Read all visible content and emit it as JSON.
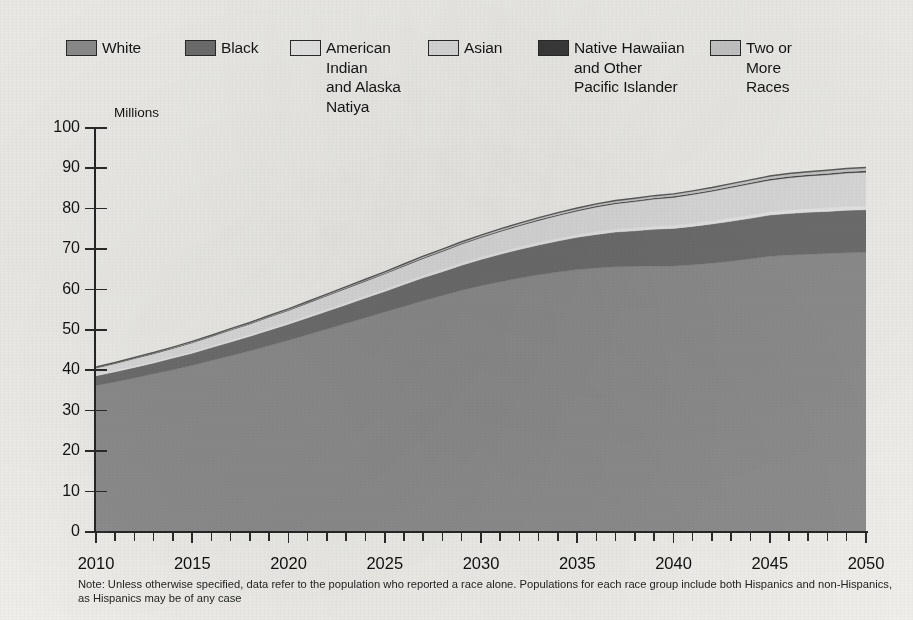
{
  "legend": {
    "items": [
      {
        "label": "White",
        "color": "#8e8e8e",
        "swatch_name": "legend-swatch-white"
      },
      {
        "label": "Black",
        "color": "#6f6f6f",
        "swatch_name": "legend-swatch-black"
      },
      {
        "label": "American Indian\nand Alaska\nNatiya",
        "color": "#e9e9e9",
        "swatch_name": "legend-swatch-american-indian"
      },
      {
        "label": "Asian",
        "color": "#dddddd",
        "swatch_name": "legend-swatch-asian"
      },
      {
        "label": "Native Hawaiian\nand Other\nPacific Islander",
        "color": "#3a3a3a",
        "swatch_name": "legend-swatch-native-hawaiian"
      },
      {
        "label": "Two or\nMore\nRaces",
        "color": "#c9c9c9",
        "swatch_name": "legend-swatch-two-or-more"
      }
    ]
  },
  "axes": {
    "y_axis_title": "Millions",
    "y_ticks": [
      "100",
      "90",
      "80",
      "70",
      "60",
      "50",
      "40",
      "30",
      "20",
      "10",
      "0"
    ],
    "x_ticks": [
      "2010",
      "2015",
      "2020",
      "2025",
      "2030",
      "2035",
      "2040",
      "2045",
      "2050"
    ]
  },
  "footnote": {
    "text": "Note: Unless otherwise specified, data refer to the population who reported a race alone. Populations for each race group include both Hispanics and non-Hispanics, as Hispanics may be of any case"
  },
  "chart_data": {
    "type": "area",
    "stacked": true,
    "title": "",
    "subtitle": "",
    "xlabel": "",
    "ylabel": "Millions",
    "xlim": [
      2010,
      2050
    ],
    "ylim": [
      0,
      100
    ],
    "y_tick_step": 10,
    "x_tick_step_minor": 1,
    "x_tick_step_major": 5,
    "grid": false,
    "legend_position": "top",
    "x": [
      2010,
      2011,
      2012,
      2013,
      2014,
      2015,
      2016,
      2017,
      2018,
      2019,
      2020,
      2021,
      2022,
      2023,
      2024,
      2025,
      2026,
      2027,
      2028,
      2029,
      2030,
      2031,
      2032,
      2033,
      2034,
      2035,
      2036,
      2037,
      2038,
      2039,
      2040,
      2041,
      2042,
      2043,
      2044,
      2045,
      2046,
      2047,
      2048,
      2049,
      2050
    ],
    "series": [
      {
        "name": "White",
        "color": "#8e8e8e",
        "values": [
          36.0,
          36.9,
          37.9,
          38.9,
          39.9,
          41.0,
          42.2,
          43.4,
          44.6,
          45.9,
          47.2,
          48.6,
          50.0,
          51.4,
          52.8,
          54.2,
          55.6,
          57.0,
          58.3,
          59.6,
          60.7,
          61.7,
          62.6,
          63.4,
          64.1,
          64.7,
          65.1,
          65.4,
          65.5,
          65.6,
          65.6,
          65.9,
          66.3,
          66.8,
          67.4,
          68.0,
          68.3,
          68.5,
          68.7,
          68.9,
          69.0
        ]
      },
      {
        "name": "Black",
        "color": "#6f6f6f",
        "values": [
          2.4,
          2.5,
          2.6,
          2.7,
          2.9,
          3.0,
          3.2,
          3.4,
          3.6,
          3.8,
          4.0,
          4.2,
          4.4,
          4.6,
          4.9,
          5.1,
          5.4,
          5.7,
          5.9,
          6.2,
          6.5,
          6.8,
          7.1,
          7.4,
          7.7,
          8.0,
          8.3,
          8.6,
          8.8,
          9.1,
          9.3,
          9.5,
          9.7,
          9.9,
          10.0,
          10.2,
          10.3,
          10.4,
          10.4,
          10.5,
          10.5
        ]
      },
      {
        "name": "American Indian and Alaska Natiya",
        "color": "#e9e9e9",
        "values": [
          0.35,
          0.36,
          0.37,
          0.38,
          0.39,
          0.4,
          0.42,
          0.43,
          0.44,
          0.46,
          0.47,
          0.49,
          0.5,
          0.52,
          0.53,
          0.55,
          0.56,
          0.58,
          0.59,
          0.61,
          0.62,
          0.64,
          0.65,
          0.67,
          0.68,
          0.7,
          0.71,
          0.73,
          0.74,
          0.76,
          0.77,
          0.79,
          0.8,
          0.82,
          0.83,
          0.85,
          0.86,
          0.88,
          0.89,
          0.91,
          0.92
        ]
      },
      {
        "name": "Asian",
        "color": "#dddddd",
        "values": [
          1.6,
          1.7,
          1.8,
          1.9,
          2.0,
          2.2,
          2.3,
          2.5,
          2.6,
          2.8,
          2.9,
          3.1,
          3.3,
          3.5,
          3.6,
          3.8,
          4.0,
          4.2,
          4.4,
          4.6,
          4.8,
          5.0,
          5.2,
          5.4,
          5.6,
          5.8,
          6.1,
          6.3,
          6.5,
          6.7,
          6.9,
          7.1,
          7.3,
          7.5,
          7.7,
          7.8,
          8.0,
          8.1,
          8.2,
          8.3,
          8.4
        ]
      },
      {
        "name": "Native Hawaiian and Other Pacific Islander",
        "color": "#3a3a3a",
        "values": [
          0.1,
          0.1,
          0.11,
          0.11,
          0.12,
          0.12,
          0.13,
          0.13,
          0.14,
          0.14,
          0.15,
          0.15,
          0.16,
          0.16,
          0.17,
          0.17,
          0.18,
          0.18,
          0.19,
          0.19,
          0.2,
          0.21,
          0.21,
          0.22,
          0.22,
          0.23,
          0.24,
          0.24,
          0.25,
          0.25,
          0.26,
          0.27,
          0.27,
          0.28,
          0.28,
          0.29,
          0.3,
          0.3,
          0.31,
          0.31,
          0.32
        ]
      },
      {
        "name": "Two or More Races",
        "color": "#c9c9c9",
        "values": [
          0.15,
          0.16,
          0.17,
          0.18,
          0.19,
          0.2,
          0.21,
          0.22,
          0.23,
          0.25,
          0.26,
          0.27,
          0.29,
          0.3,
          0.32,
          0.33,
          0.35,
          0.36,
          0.38,
          0.4,
          0.41,
          0.43,
          0.45,
          0.47,
          0.49,
          0.51,
          0.53,
          0.55,
          0.57,
          0.59,
          0.61,
          0.63,
          0.65,
          0.68,
          0.7,
          0.72,
          0.74,
          0.76,
          0.78,
          0.8,
          0.82
        ]
      }
    ],
    "totals": [
      40.6,
      41.7,
      42.9,
      44.2,
      45.5,
      46.9,
      48.4,
      49.9,
      51.5,
      53.2,
      55.0,
      56.8,
      58.6,
      60.5,
      62.3,
      64.1,
      66.1,
      68.0,
      69.8,
      71.6,
      73.2,
      74.8,
      76.2,
      77.6,
      78.8,
      79.9,
      80.9,
      81.8,
      82.3,
      82.9,
      83.4,
      84.2,
      85.0,
      85.9,
      86.9,
      87.9,
      88.5,
      88.9,
      89.3,
      89.7,
      89.9
    ]
  }
}
